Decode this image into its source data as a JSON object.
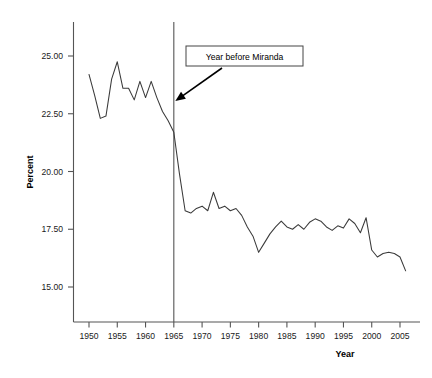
{
  "chart_data": {
    "type": "line",
    "title": "",
    "xlabel": "Year",
    "ylabel": "Percent",
    "xlim": [
      1948,
      2008
    ],
    "ylim": [
      14.0,
      26.2
    ],
    "grid": false,
    "legend": null,
    "xticks": [
      1950,
      1955,
      1960,
      1965,
      1970,
      1975,
      1980,
      1985,
      1990,
      1995,
      2000,
      2005
    ],
    "xticklabels": [
      "1950",
      "1955",
      "1960",
      "1965",
      "1970",
      "1975",
      "1980",
      "1985",
      "1990",
      "1995",
      "2000",
      "2005"
    ],
    "yticks": [
      15.0,
      17.5,
      20.0,
      22.5,
      25.0
    ],
    "yticklabels": [
      "15.00",
      "17.50",
      "20.00",
      "22.50",
      "25.00"
    ],
    "series": [
      {
        "name": "Percent",
        "x": [
          1950,
          1951,
          1952,
          1953,
          1954,
          1955,
          1956,
          1957,
          1958,
          1959,
          1960,
          1961,
          1962,
          1963,
          1964,
          1965,
          1966,
          1967,
          1968,
          1969,
          1970,
          1971,
          1972,
          1973,
          1974,
          1975,
          1976,
          1977,
          1978,
          1979,
          1980,
          1981,
          1982,
          1983,
          1984,
          1985,
          1986,
          1987,
          1988,
          1989,
          1990,
          1991,
          1992,
          1993,
          1994,
          1995,
          1996,
          1997,
          1998,
          1999,
          2000,
          2001,
          2002,
          2003,
          2004,
          2005,
          2006
        ],
        "values": [
          24.2,
          23.3,
          22.3,
          22.4,
          24.0,
          24.75,
          23.6,
          23.6,
          23.1,
          23.9,
          23.2,
          23.9,
          23.2,
          22.6,
          22.2,
          21.7,
          19.9,
          18.3,
          18.2,
          18.4,
          18.5,
          18.3,
          19.1,
          18.4,
          18.5,
          18.3,
          18.4,
          18.1,
          17.6,
          17.2,
          16.5,
          16.9,
          17.3,
          17.6,
          17.85,
          17.6,
          17.5,
          17.7,
          17.5,
          17.8,
          17.95,
          17.85,
          17.6,
          17.45,
          17.65,
          17.55,
          17.95,
          17.75,
          17.35,
          18.0,
          16.6,
          16.3,
          16.45,
          16.5,
          16.45,
          16.3,
          15.7
        ]
      }
    ],
    "annotations": [
      {
        "name": "year-before-miranda",
        "text": "Year before Miranda",
        "points_to_x": 1965,
        "points_to_y": 23.05,
        "vertical_reference_line_x": 1965
      }
    ]
  },
  "axes": {
    "y_title": "Percent",
    "x_title": "Year"
  },
  "annotation": {
    "label": "Year before Miranda"
  }
}
